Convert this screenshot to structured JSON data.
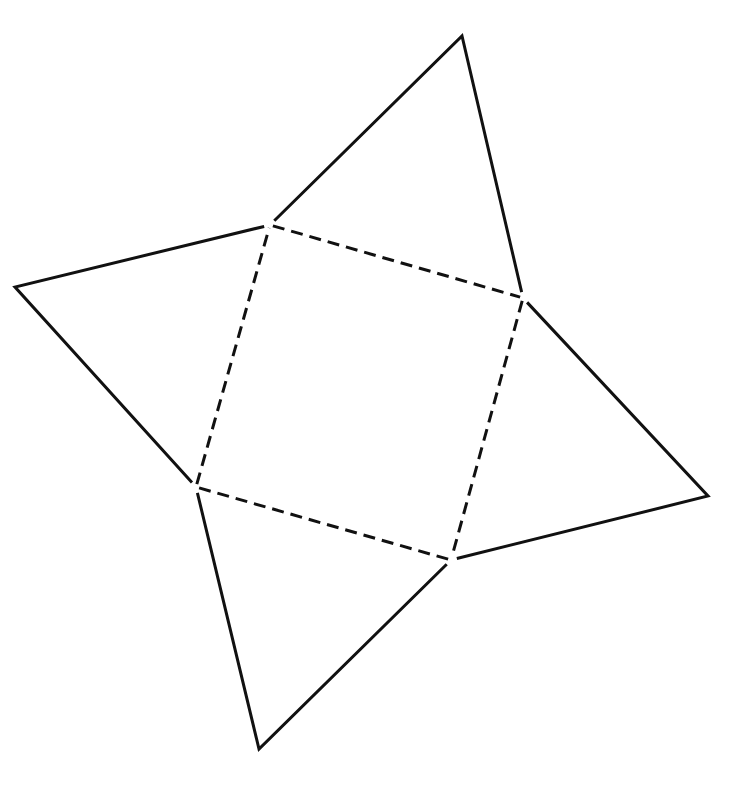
{
  "diagram": {
    "background": "#ffffff",
    "stroke_color": "#111111",
    "stroke_width": 3,
    "dash_pattern": "12 7",
    "square_base": {
      "vertices": [
        [
          270,
          225
        ],
        [
          523,
          298
        ],
        [
          451,
          560
        ],
        [
          196,
          487
        ]
      ],
      "edge_style": "dashed"
    },
    "triangular_faces": [
      {
        "name": "top-face",
        "base": [
          [
            270,
            225
          ],
          [
            523,
            298
          ]
        ],
        "apex": [
          462,
          36
        ]
      },
      {
        "name": "right-face",
        "base": [
          [
            523,
            298
          ],
          [
            451,
            560
          ]
        ],
        "apex": [
          708,
          496
        ]
      },
      {
        "name": "bottom-face",
        "base": [
          [
            451,
            560
          ],
          [
            196,
            487
          ]
        ],
        "apex": [
          259,
          749
        ]
      },
      {
        "name": "left-face",
        "base": [
          [
            196,
            487
          ],
          [
            270,
            225
          ]
        ],
        "apex": [
          15,
          287
        ]
      }
    ]
  }
}
